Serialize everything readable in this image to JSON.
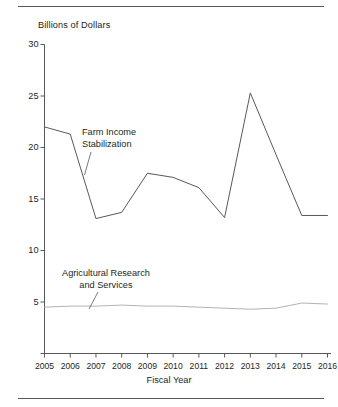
{
  "figure": {
    "ylabel": "Billions of Dollars",
    "xlabel": "Fiscal Year",
    "series_label_farm": "Farm Income\nStabilization",
    "series_label_ag": "Agricultural Research\nand Services",
    "axis_color": "#58585a",
    "line_color_farm": "#58585a",
    "line_color_ag": "#a7a9ac",
    "rule_color": "#58585a"
  },
  "chart_data": {
    "type": "line",
    "title": "",
    "xlabel": "Fiscal Year",
    "ylabel": "Billions of Dollars",
    "x": [
      2005,
      2006,
      2007,
      2008,
      2009,
      2010,
      2011,
      2012,
      2013,
      2014,
      2015,
      2016
    ],
    "categories": [
      "2005",
      "2006",
      "2007",
      "2008",
      "2009",
      "2010",
      "2011",
      "2012",
      "2013",
      "2014",
      "2015",
      "2016"
    ],
    "xlim": [
      2005,
      2016
    ],
    "ylim": [
      0,
      30
    ],
    "yticks": [
      5,
      10,
      15,
      20,
      25,
      30
    ],
    "ytick_labels": [
      "5",
      "10",
      "15",
      "20",
      "25",
      "30"
    ],
    "grid": false,
    "legend": "inline-annotations",
    "series": [
      {
        "name": "Farm Income Stabilization",
        "values": [
          22.0,
          21.3,
          13.1,
          13.7,
          17.5,
          17.1,
          16.1,
          13.2,
          25.3,
          19.3,
          13.4,
          13.4
        ]
      },
      {
        "name": "Agricultural Research and Services",
        "values": [
          4.5,
          4.6,
          4.6,
          4.7,
          4.6,
          4.6,
          4.5,
          4.4,
          4.3,
          4.4,
          4.9,
          4.8
        ]
      }
    ],
    "annotations": [
      {
        "text": "Farm Income Stabilization",
        "series": "Farm Income Stabilization"
      },
      {
        "text": "Agricultural Research and Services",
        "series": "Agricultural Research and Services"
      }
    ]
  }
}
